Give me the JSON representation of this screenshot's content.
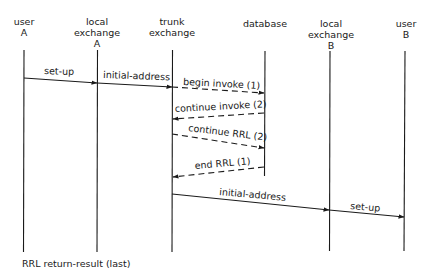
{
  "participants": [
    {
      "id": "userA",
      "lines": [
        "user",
        "A"
      ],
      "x": 24
    },
    {
      "id": "localA",
      "lines": [
        "local",
        "exchange",
        "A"
      ],
      "x": 97
    },
    {
      "id": "trunk",
      "lines": [
        "trunk",
        "exchange"
      ],
      "x": 172
    },
    {
      "id": "database",
      "lines": [
        "database"
      ],
      "x": 265
    },
    {
      "id": "localB",
      "lines": [
        "local",
        "exchange",
        "B"
      ],
      "x": 329
    },
    {
      "id": "userB",
      "lines": [
        "user",
        "B"
      ],
      "x": 404
    }
  ],
  "messages": [
    {
      "label": "set-up",
      "from": "userA",
      "to": "localA",
      "style": "solid"
    },
    {
      "label": "initial-address",
      "from": "localA",
      "to": "trunk",
      "style": "solid"
    },
    {
      "label": "begin invoke (1)",
      "from": "trunk",
      "to": "database",
      "style": "dashed"
    },
    {
      "label": "continue invoke (2)",
      "from": "database",
      "to": "trunk",
      "style": "dashed"
    },
    {
      "label": "continue RRL (2)",
      "from": "trunk",
      "to": "database",
      "style": "dashed"
    },
    {
      "label": "end RRL (1)",
      "from": "database",
      "to": "trunk",
      "style": "dashed"
    },
    {
      "label": "initial-address",
      "from": "trunk",
      "to": "localB",
      "style": "solid"
    },
    {
      "label": "set-up",
      "from": "localB",
      "to": "userB",
      "style": "solid"
    }
  ],
  "legend": "RRL return-result (last)",
  "colors": {
    "line": "#1a1a1a",
    "background": "#ffffff"
  }
}
